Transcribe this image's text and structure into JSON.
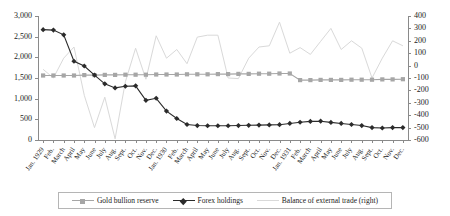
{
  "chart_data": {
    "type": "line",
    "title": "",
    "xlabel": "",
    "ylabel": "",
    "y2label": "",
    "grid": false,
    "legend_position": "bottom",
    "ylim": [
      0,
      3000
    ],
    "yticks": [
      "0",
      "500",
      "1,000",
      "1,500",
      "2,000",
      "2,500",
      "3,000"
    ],
    "y2lim": [
      -600,
      400
    ],
    "y2ticks": [
      "-600",
      "-500",
      "-400",
      "-300",
      "-200",
      "-100",
      "0",
      "100",
      "200",
      "300",
      "400"
    ],
    "categories": [
      "Jan. 1929",
      "Feb.",
      "March",
      "April",
      "May",
      "June",
      "July",
      "Aug.",
      "Sept.",
      "Oct.",
      "Nov.",
      "Dec.",
      "Jan. 1930",
      "Feb.",
      "March",
      "April",
      "May",
      "June",
      "July",
      "Aug.",
      "Sept.",
      "Oct.",
      "Nov.",
      "Dec.",
      "Jan. 1931",
      "Feb.",
      "March",
      "April",
      "May",
      "June",
      "July",
      "Aug.",
      "Sept.",
      "Oct.",
      "Nov.",
      "Dec."
    ],
    "series": [
      {
        "name": "Gold bullion reserve",
        "axis": "left",
        "color": "#a6a6a6",
        "marker": "square",
        "values": [
          1560,
          1560,
          1560,
          1560,
          1570,
          1570,
          1575,
          1575,
          1580,
          1580,
          1580,
          1585,
          1585,
          1585,
          1590,
          1590,
          1590,
          1595,
          1595,
          1600,
          1600,
          1605,
          1605,
          1610,
          1610,
          1450,
          1450,
          1455,
          1455,
          1455,
          1460,
          1460,
          1460,
          1465,
          1465,
          1470
        ]
      },
      {
        "name": "Forex holdings",
        "axis": "left",
        "color": "#2b2b2b",
        "marker": "diamond",
        "values": [
          2670,
          2660,
          2545,
          1905,
          1790,
          1570,
          1360,
          1260,
          1300,
          1310,
          960,
          1010,
          700,
          520,
          375,
          350,
          345,
          345,
          345,
          350,
          355,
          360,
          365,
          370,
          400,
          430,
          450,
          455,
          425,
          400,
          375,
          350,
          300,
          290,
          300,
          300
        ]
      },
      {
        "name": "Balance of external trade (right)",
        "axis": "right",
        "color": "#d9d9d9",
        "marker": "none",
        "values": [
          -30,
          -100,
          60,
          150,
          -240,
          -500,
          -255,
          -590,
          -130,
          140,
          -110,
          240,
          60,
          130,
          15,
          230,
          245,
          245,
          -100,
          -105,
          60,
          150,
          160,
          350,
          100,
          145,
          90,
          195,
          300,
          130,
          200,
          140,
          -100,
          60,
          200,
          160
        ]
      }
    ]
  },
  "legend": {
    "items": [
      {
        "label": "Gold bullion reserve"
      },
      {
        "label": "Forex holdings"
      },
      {
        "label": "Balance of external trade (right)"
      }
    ]
  }
}
